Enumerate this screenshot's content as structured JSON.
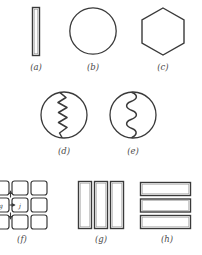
{
  "figure": {
    "background_color": "#ffffff",
    "stroke_color": "#3a3a3a",
    "label_color": "#4a4a4a",
    "panel_count": 8
  },
  "panels": [
    {
      "id": "a",
      "label": "(a)",
      "shape": "tall-thin-rectangle",
      "description": "narrow vertical rectangle outline"
    },
    {
      "id": "b",
      "label": "(b)",
      "shape": "circle",
      "description": "plain circle outline"
    },
    {
      "id": "c",
      "label": "(c)",
      "shape": "hexagon",
      "description": "regular hexagon outline"
    },
    {
      "id": "d",
      "label": "(d)",
      "shape": "circle-with-zigzag",
      "description": "circle bisected by a sharp vertical zigzag line"
    },
    {
      "id": "e",
      "label": "(e)",
      "shape": "circle-with-wave",
      "description": "circle bisected by a smooth vertical sine wave"
    },
    {
      "id": "f",
      "label": "(f)",
      "shape": "grid-3x3",
      "description": "three by three grid of rounded squares with arrow annotations",
      "annotations": [
        {
          "text": "g",
          "position": "middle-left-cell"
        },
        {
          "text": "j",
          "position": "middle-center-cell"
        }
      ]
    },
    {
      "id": "g",
      "label": "(g)",
      "shape": "three-vertical-bars",
      "description": "three tall vertical rectangles side by side",
      "bar_count": 3
    },
    {
      "id": "h",
      "label": "(h)",
      "shape": "three-horizontal-bars",
      "description": "three wide horizontal rectangles stacked vertically",
      "bar_count": 3
    }
  ]
}
